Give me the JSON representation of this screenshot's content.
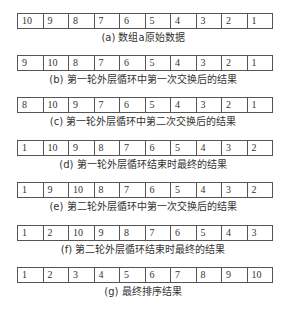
{
  "figure": {
    "steps": [
      {
        "values": [
          "10",
          "9",
          "8",
          "7",
          "6",
          "5",
          "4",
          "3",
          "2",
          "1"
        ],
        "caption": "(a) 数组a原始数据"
      },
      {
        "values": [
          "9",
          "10",
          "8",
          "7",
          "6",
          "5",
          "4",
          "3",
          "2",
          "1"
        ],
        "caption": "(b) 第一轮外层循环中第一次交换后的结果"
      },
      {
        "values": [
          "8",
          "10",
          "9",
          "7",
          "6",
          "5",
          "4",
          "3",
          "2",
          "1"
        ],
        "caption": "(c) 第一轮外层循环中第二次交换后的结果"
      },
      {
        "values": [
          "1",
          "10",
          "9",
          "8",
          "7",
          "6",
          "5",
          "4",
          "3",
          "2"
        ],
        "caption": "(d) 第一轮外层循环结束时最终的结果"
      },
      {
        "values": [
          "1",
          "9",
          "10",
          "8",
          "7",
          "6",
          "5",
          "4",
          "3",
          "2"
        ],
        "caption": "(e) 第二轮外层循环中第一次交换后的结果"
      },
      {
        "values": [
          "1",
          "2",
          "10",
          "9",
          "8",
          "7",
          "6",
          "5",
          "4",
          "3"
        ],
        "caption": "(f) 第二轮外层循环结束时最终的结果"
      },
      {
        "values": [
          "1",
          "2",
          "3",
          "4",
          "5",
          "6",
          "7",
          "8",
          "9",
          "10"
        ],
        "caption": "(g) 最终排序结果"
      }
    ]
  }
}
